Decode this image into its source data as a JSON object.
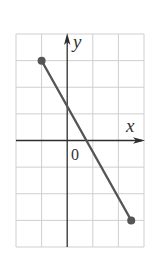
{
  "chart_data": {
    "type": "line",
    "title": "",
    "xlabel": "x",
    "ylabel": "y",
    "origin_label": "0",
    "xlim": [
      -2,
      3
    ],
    "ylim": [
      -4,
      4
    ],
    "grid": true,
    "grid_step": 1,
    "legend": null,
    "series": [
      {
        "name": "segment",
        "x": [
          -1,
          2.5
        ],
        "y": [
          3,
          -3
        ],
        "endpoints": "closed-dots"
      }
    ],
    "intercepts": {
      "y_intercept": 1.29,
      "x_intercept": 0.75
    }
  },
  "labels": {
    "x_axis": "x",
    "y_axis": "y",
    "origin": "0"
  },
  "colors": {
    "grid": "#cfcfcf",
    "axis": "#2e2e2e",
    "segment": "#555555",
    "endpoint": "#555555",
    "background": "#ffffff"
  }
}
